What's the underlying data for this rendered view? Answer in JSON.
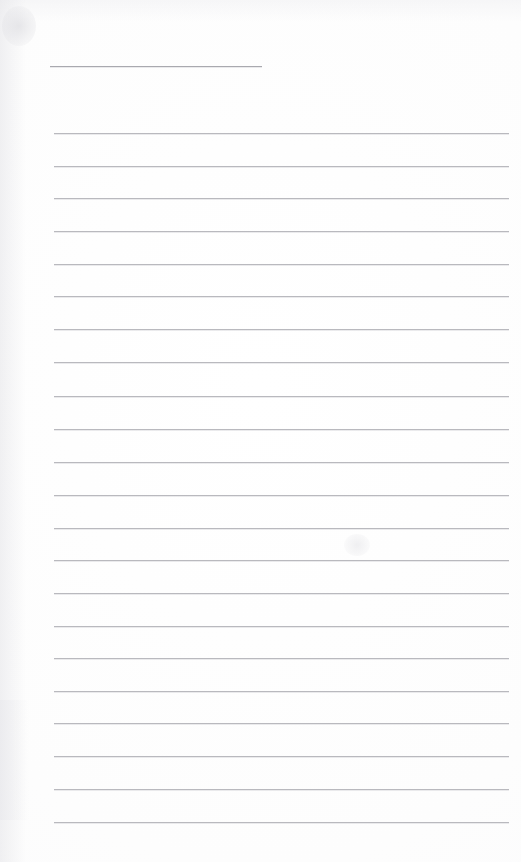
{
  "document": {
    "kind": "blank-ruled-notebook-page",
    "title": "",
    "body_text": "",
    "page_width": 521,
    "page_height": 862,
    "background_color": "#fefefe",
    "rule_color": "#b9b9be",
    "header_rule_color": "#a9a9af",
    "is_blank": true,
    "visible_text_count": 0
  },
  "header_rule": {
    "name": "title-rule",
    "x": 50,
    "y": 66,
    "width": 212,
    "length_label": ""
  },
  "ruling": {
    "left_margin": 54,
    "right_edge": 509,
    "line_width": 455,
    "first_line_y": 133,
    "line_spacing": 32.7,
    "line_count": 22,
    "lines": [
      {
        "index": 1,
        "y": 133
      },
      {
        "index": 2,
        "y": 166
      },
      {
        "index": 3,
        "y": 198
      },
      {
        "index": 4,
        "y": 231
      },
      {
        "index": 5,
        "y": 264
      },
      {
        "index": 6,
        "y": 296
      },
      {
        "index": 7,
        "y": 329
      },
      {
        "index": 8,
        "y": 362
      },
      {
        "index": 9,
        "y": 396
      },
      {
        "index": 10,
        "y": 429
      },
      {
        "index": 11,
        "y": 462
      },
      {
        "index": 12,
        "y": 495
      },
      {
        "index": 13,
        "y": 528
      },
      {
        "index": 14,
        "y": 560
      },
      {
        "index": 15,
        "y": 593
      },
      {
        "index": 16,
        "y": 626
      },
      {
        "index": 17,
        "y": 658
      },
      {
        "index": 18,
        "y": 691
      },
      {
        "index": 19,
        "y": 723
      },
      {
        "index": 20,
        "y": 756
      },
      {
        "index": 21,
        "y": 789
      },
      {
        "index": 22,
        "y": 822
      }
    ]
  }
}
